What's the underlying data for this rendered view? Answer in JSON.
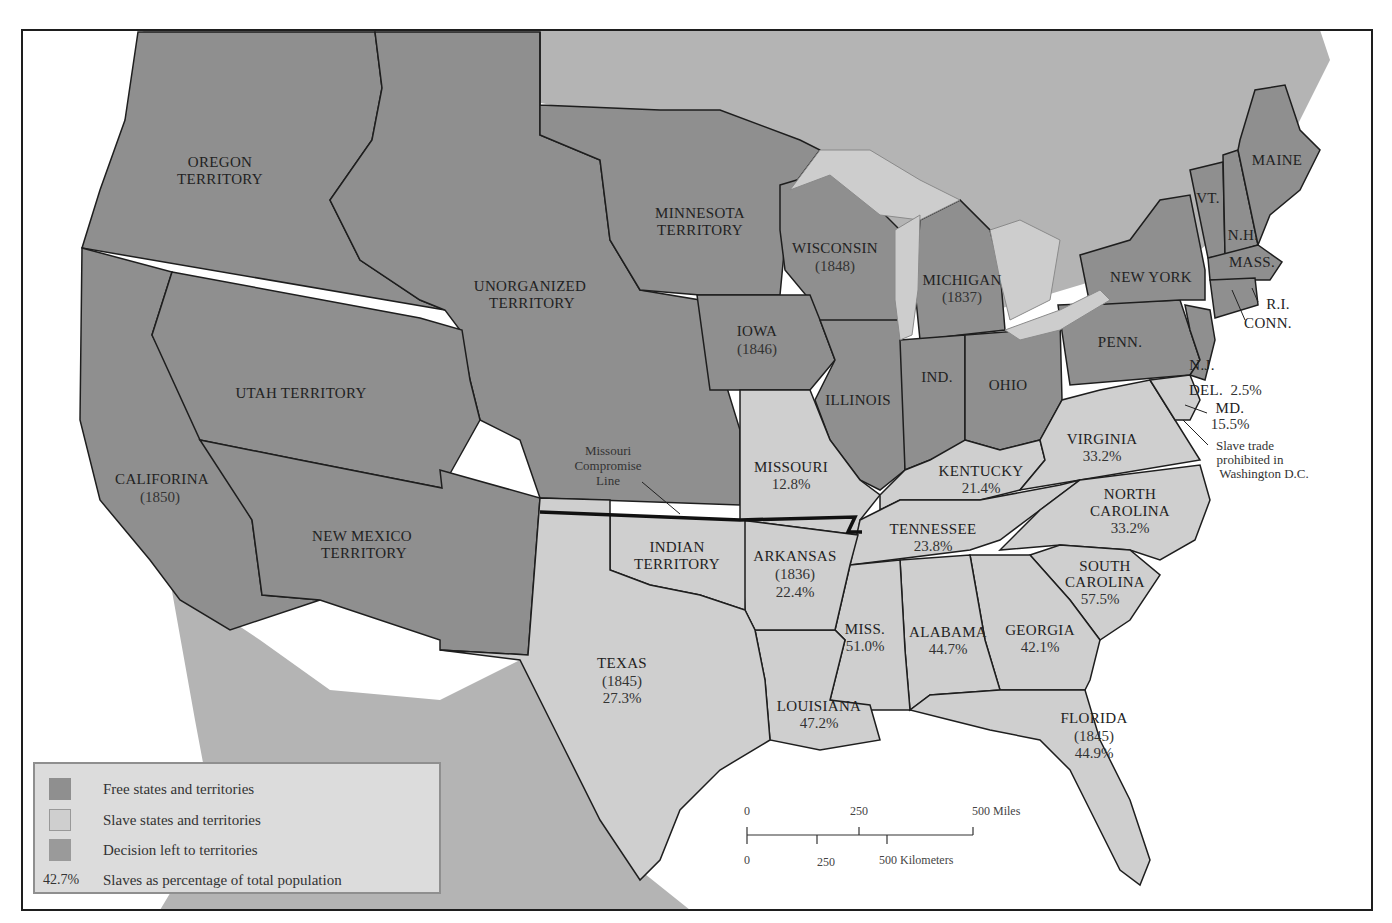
{
  "colors": {
    "free": "#8f8f8f",
    "slave": "#cfcfcf",
    "territory_decision": "#9a9a9a",
    "foreign_land": "#b4b4b4",
    "water": "#ffffff",
    "lakes": "#cdcdcd",
    "border": "#1e1e1e",
    "compromise_line": "#111111"
  },
  "regions": {
    "oregon": {
      "name1": "OREGON",
      "name2": "TERRITORY"
    },
    "unorganized": {
      "name1": "UNORGANIZED",
      "name2": "TERRITORY"
    },
    "minnesota": {
      "name1": "MINNESOTA",
      "name2": "TERRITORY"
    },
    "utah": {
      "name1": "UTAH TERRITORY"
    },
    "california": {
      "name1": "CALIFORINA",
      "year": "(1850)"
    },
    "new_mexico": {
      "name1": "NEW MEXICO",
      "name2": "TERRITORY"
    },
    "wisconsin": {
      "name1": "WISCONSIN",
      "year": "(1848)"
    },
    "michigan": {
      "name1": "MICHIGAN",
      "year": "(1837)"
    },
    "iowa": {
      "name1": "IOWA",
      "year": "(1846)"
    },
    "illinois": {
      "name1": "ILLINOIS"
    },
    "indiana": {
      "name1": "IND."
    },
    "ohio": {
      "name1": "OHIO"
    },
    "new_york": {
      "name1": "NEW YORK"
    },
    "penn": {
      "name1": "PENN."
    },
    "nj": {
      "name1": "N.J."
    },
    "maine": {
      "name1": "MAINE"
    },
    "vt": {
      "name1": "VT."
    },
    "nh": {
      "name1": "N.H."
    },
    "mass": {
      "name1": "MASS."
    },
    "ri": {
      "name1": "R.I."
    },
    "conn": {
      "name1": "CONN."
    },
    "del": {
      "name1": "DEL.",
      "pct": "2.5%"
    },
    "md": {
      "name1": "MD.",
      "pct": "15.5%"
    },
    "dc_note": {
      "line1": "Slave trade",
      "line2": "prohibited in",
      "line3": "Washington D.C."
    },
    "missouri": {
      "name1": "MISSOURI",
      "pct": "12.8%"
    },
    "kentucky": {
      "name1": "KENTUCKY",
      "pct": "21.4%"
    },
    "virginia": {
      "name1": "VIRGINIA",
      "pct": "33.2%"
    },
    "north_carolina": {
      "name1": "NORTH",
      "name2": "CAROLINA",
      "pct": "33.2%"
    },
    "tennessee": {
      "name1": "TENNESSEE",
      "pct": "23.8%"
    },
    "south_carolina": {
      "name1": "SOUTH",
      "name2": "CAROLINA",
      "pct": "57.5%"
    },
    "arkansas": {
      "name1": "ARKANSAS",
      "year": "(1836)",
      "pct": "22.4%"
    },
    "indian": {
      "name1": "INDIAN",
      "name2": "TERRITORY"
    },
    "texas": {
      "name1": "TEXAS",
      "year": "(1845)",
      "pct": "27.3%"
    },
    "mississippi": {
      "name1": "MISS.",
      "pct": "51.0%"
    },
    "alabama": {
      "name1": "ALABAMA",
      "pct": "44.7%"
    },
    "georgia": {
      "name1": "GEORGIA",
      "pct": "42.1%"
    },
    "louisiana": {
      "name1": "LOUISIANA",
      "pct": "47.2%"
    },
    "florida": {
      "name1": "FLORIDA",
      "year": "(1845)",
      "pct": "44.9%"
    }
  },
  "compromise_label": {
    "line1": "Missouri",
    "line2": "Compromise",
    "line3": "Line"
  },
  "legend": {
    "items": [
      {
        "label": "Free states and territories",
        "color": "#8f8f8f"
      },
      {
        "label": "Slave states and territories",
        "color": "#cfcfcf"
      },
      {
        "label": "Decision left to territories",
        "color": "#9a9a9a"
      }
    ],
    "pct_example": "42.7%",
    "pct_label": "Slaves as percentage of total population"
  },
  "scale": {
    "miles": {
      "t0": "0",
      "t1": "250",
      "t2": "500 Miles"
    },
    "km": {
      "t0": "0",
      "t1": "250",
      "t2": "500 Kilometers"
    }
  }
}
